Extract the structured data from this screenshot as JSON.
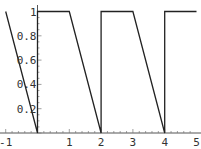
{
  "chart_data": {
    "type": "line",
    "title": "",
    "xlabel": "",
    "ylabel": "",
    "xlim": [
      -1,
      5
    ],
    "ylim": [
      0,
      1
    ],
    "grid": false,
    "x_ticks": [
      "-1",
      "1",
      "2",
      "3",
      "4",
      "5"
    ],
    "y_ticks": [
      "0.2",
      "0.4",
      "0.6",
      "0.8",
      "1"
    ],
    "series": [
      {
        "name": "sawtooth",
        "points": [
          [
            -1,
            1
          ],
          [
            0,
            0
          ],
          [
            0,
            1
          ],
          [
            1,
            1
          ],
          [
            2,
            0
          ],
          [
            2,
            1
          ],
          [
            3,
            1
          ],
          [
            4,
            0
          ],
          [
            4,
            1
          ],
          [
            5,
            1
          ]
        ]
      }
    ]
  }
}
